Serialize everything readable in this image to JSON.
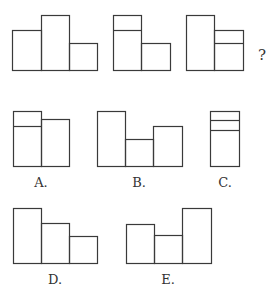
{
  "puzzle": {
    "question_mark": "?",
    "stroke_color": "#3a3a3a",
    "sequence": [
      {
        "id": "figure-1",
        "rects": [
          [
            12,
            30,
            29,
            40
          ],
          [
            41,
            15,
            28,
            55
          ],
          [
            69,
            43,
            28,
            27
          ]
        ],
        "dividers": []
      },
      {
        "id": "figure-2",
        "rects": [
          [
            113,
            15,
            28,
            55
          ],
          [
            141,
            43,
            29,
            27
          ]
        ],
        "dividers": [
          [
            113,
            30,
            141,
            30
          ]
        ]
      },
      {
        "id": "figure-3",
        "rects": [
          [
            186,
            15,
            28,
            55
          ],
          [
            214,
            30,
            29,
            40
          ]
        ],
        "dividers": [
          [
            214,
            43,
            243,
            43
          ]
        ]
      }
    ],
    "options": [
      {
        "label": "A.",
        "label_pos": [
          41,
          187
        ],
        "rects": [
          [
            13,
            111,
            28,
            55
          ],
          [
            41,
            119,
            28,
            47
          ]
        ],
        "dividers": [
          [
            13,
            126,
            41,
            126
          ]
        ]
      },
      {
        "label": "B.",
        "label_pos": [
          139,
          187
        ],
        "rects": [
          [
            97,
            111,
            28,
            55
          ],
          [
            125,
            139,
            28,
            27
          ],
          [
            153,
            126,
            29,
            40
          ]
        ],
        "dividers": []
      },
      {
        "label": "C.",
        "label_pos": [
          225,
          187
        ],
        "rects": [
          [
            210,
            111,
            29,
            55
          ]
        ],
        "dividers": [
          [
            210,
            120,
            239,
            120
          ],
          [
            210,
            130,
            239,
            130
          ]
        ]
      },
      {
        "label": "D.",
        "label_pos": [
          55,
          284
        ],
        "rects": [
          [
            13,
            208,
            28,
            55
          ],
          [
            41,
            223,
            28,
            40
          ],
          [
            69,
            236,
            28,
            27
          ]
        ],
        "dividers": []
      },
      {
        "label": "E.",
        "label_pos": [
          168,
          284
        ],
        "rects": [
          [
            126,
            224,
            28,
            39
          ],
          [
            154,
            235,
            28,
            28
          ],
          [
            182,
            208,
            29,
            55
          ]
        ],
        "dividers": []
      }
    ]
  }
}
